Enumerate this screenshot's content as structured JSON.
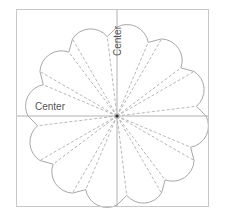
{
  "diagram": {
    "type": "pattern-template",
    "petal_count": 12,
    "labels": {
      "vertical_axis": "Center",
      "horizontal_axis": "Center"
    },
    "colors": {
      "frame": "#c8c8c8",
      "axis": "#b0b0b0",
      "outline": "#a8a8a8",
      "dashed": "#b8b8b8",
      "center_dot": "#333333",
      "label": "#555555"
    }
  }
}
